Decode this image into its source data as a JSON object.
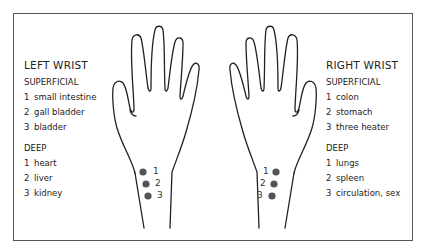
{
  "left_wrist": {
    "title": "LEFT WRIST",
    "superficial": {
      "label": "SUPERFICIAL",
      "items": [
        {
          "n": "1",
          "name": "small intestine"
        },
        {
          "n": "2",
          "name": "gall bladder"
        },
        {
          "n": "3",
          "name": "bladder"
        }
      ]
    },
    "deep": {
      "label": "DEEP",
      "items": [
        {
          "n": "1",
          "name": "heart"
        },
        {
          "n": "2",
          "name": "liver"
        },
        {
          "n": "3",
          "name": "kidney"
        }
      ]
    },
    "pulse_points": [
      "1",
      "2",
      "3"
    ]
  },
  "right_wrist": {
    "title": "RIGHT WRIST",
    "superficial": {
      "label": "SUPERFICIAL",
      "items": [
        {
          "n": "1",
          "name": "colon"
        },
        {
          "n": "2",
          "name": "stomach"
        },
        {
          "n": "3",
          "name": "three heater"
        }
      ]
    },
    "deep": {
      "label": "DEEP",
      "items": [
        {
          "n": "1",
          "name": "lungs"
        },
        {
          "n": "2",
          "name": "spleen"
        },
        {
          "n": "3",
          "name": "circulation, sex"
        }
      ]
    },
    "pulse_points": [
      "1",
      "2",
      "3"
    ]
  },
  "colors": {
    "dot": "#555555",
    "outline": "#222222",
    "frame": "#555555"
  }
}
